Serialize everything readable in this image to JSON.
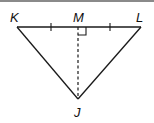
{
  "diagram": {
    "type": "triangle",
    "title": "",
    "points": {
      "K": {
        "label": "K",
        "x": 17,
        "y": 27
      },
      "M": {
        "label": "M",
        "x": 78,
        "y": 27
      },
      "L": {
        "label": "L",
        "x": 141,
        "y": 27
      },
      "J": {
        "label": "J",
        "x": 78,
        "y": 99
      }
    },
    "segments": [
      {
        "from": "K",
        "to": "L",
        "style": "solid"
      },
      {
        "from": "K",
        "to": "J",
        "style": "solid"
      },
      {
        "from": "L",
        "to": "J",
        "style": "solid"
      },
      {
        "from": "M",
        "to": "J",
        "style": "dashed"
      }
    ],
    "marks": {
      "tick_KM": "congruent tick on KM",
      "tick_ML": "congruent tick on ML",
      "right_angle_at": "M"
    },
    "colors": {
      "stroke": "#1a1a1a",
      "border": "#8a8a8a"
    }
  }
}
